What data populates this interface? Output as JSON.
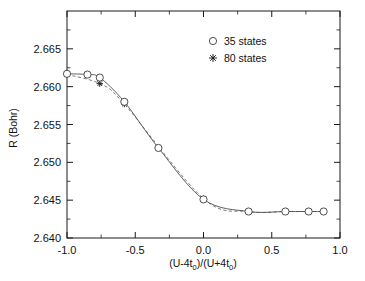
{
  "figure": {
    "background": "#ffffff",
    "frame_color": "#1a1a1a"
  },
  "axes": {
    "x": {
      "title_parts": {
        "p1": "(U-4t",
        "sub1": "0",
        "p2": ")/(U+4t",
        "sub2": "0",
        "p3": ")"
      },
      "title_plain": "(U-4t0)/(U+4t0)",
      "min": -1.0,
      "max": 1.0,
      "tick_values": [
        -1.0,
        -0.5,
        0.0,
        0.5,
        1.0
      ],
      "tick_labels": [
        "-1.0",
        "-0.5",
        "0.0",
        "0.5",
        "1.0"
      ],
      "minor_per_interval": 1
    },
    "y": {
      "title": "R  (Bohr)",
      "min": 2.64,
      "max": 2.67,
      "tick_values": [
        2.64,
        2.645,
        2.65,
        2.655,
        2.66,
        2.665
      ],
      "tick_labels": [
        "2.640",
        "2.645",
        "2.650",
        "2.655",
        "2.660",
        "2.665"
      ],
      "minor_per_interval": 1
    }
  },
  "legend": {
    "position": "top-right",
    "entries": [
      {
        "label": "35 states",
        "marker": "open-circle",
        "line": "solid"
      },
      {
        "label": "80 states",
        "marker": "plus",
        "line": "dashed"
      }
    ]
  },
  "chart_data": {
    "type": "line",
    "title": "",
    "xlabel": "(U-4t0)/(U+4t0)",
    "ylabel": "R (Bohr)",
    "xlim": [
      -1.0,
      1.0
    ],
    "ylim": [
      2.64,
      2.67
    ],
    "grid": false,
    "legend_position": "top-right",
    "series": [
      {
        "name": "35 states",
        "marker": "open-circle",
        "linestyle": "solid",
        "x": [
          -1.0,
          -0.85,
          -0.76,
          -0.58,
          -0.33,
          0.0,
          0.33,
          0.6,
          0.77,
          0.88
        ],
        "y": [
          2.6617,
          2.6616,
          2.6612,
          2.658,
          2.6519,
          2.6451,
          2.6435,
          2.6435,
          2.6435,
          2.6435
        ]
      },
      {
        "name": "80 states",
        "marker": "plus",
        "linestyle": "dashed",
        "x": [
          -1.0,
          -0.76,
          -0.58,
          0.0
        ],
        "y": [
          2.6616,
          2.6604,
          2.6577,
          2.6452
        ]
      }
    ]
  }
}
